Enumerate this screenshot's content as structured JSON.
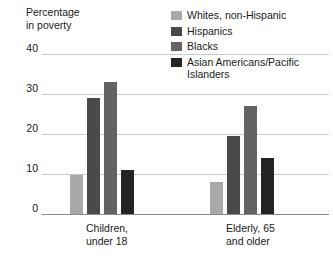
{
  "chart_data": {
    "type": "bar",
    "title": "",
    "ylabel_line1": "Percentage",
    "ylabel_line2": "in poverty",
    "xlabel": "",
    "categories": [
      "Children,\nunder 18",
      "Elderly, 65\nand older"
    ],
    "category_labels": [
      {
        "line1": "Children,",
        "line2": "under 18"
      },
      {
        "line1": "Elderly, 65",
        "line2": "and older"
      }
    ],
    "ylim": [
      0,
      40
    ],
    "yticks": [
      0,
      10,
      20,
      30,
      40
    ],
    "ytick_labels": [
      "0",
      "10",
      "20",
      "30",
      "40"
    ],
    "grid": true,
    "legend_position": "top-right",
    "series": [
      {
        "name": "Whites, non-Hispanic",
        "color": "#a9a9a9",
        "values": [
          9.8,
          8.0
        ]
      },
      {
        "name": "Hispanics",
        "color": "#4a4a4a",
        "values": [
          29.0,
          19.5
        ]
      },
      {
        "name": "Blacks",
        "color": "#636363",
        "values": [
          33.0,
          27.0
        ]
      },
      {
        "name": "Asian Americans/Pacific Islanders",
        "color": "#242424",
        "values": [
          11.0,
          14.0
        ]
      }
    ]
  },
  "legend": {
    "items": [
      {
        "label": "Whites, non-Hispanic",
        "swatch": "#a9a9a9"
      },
      {
        "label": "Hispanics",
        "swatch": "#4a4a4a"
      },
      {
        "label": "Blacks",
        "swatch": "#636363"
      },
      {
        "label": "Asian Americans/Pacific Islanders",
        "swatch": "#242424"
      }
    ]
  },
  "colors": {
    "background": "#ffffff",
    "gridline": "#c9c9c9",
    "baseline": "#8a8a8a",
    "text": "#1a1a1a"
  }
}
